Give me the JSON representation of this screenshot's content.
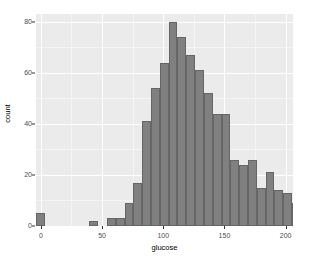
{
  "chart_data": {
    "type": "bar",
    "title": "",
    "subtitle": "",
    "xlabel": "glucose",
    "ylabel": "count",
    "xlim": [
      -4,
      206
    ],
    "ylim": [
      0,
      83
    ],
    "grid": true,
    "legend": "none",
    "x_ticks": [
      {
        "value": 0,
        "label": "0"
      },
      {
        "value": 50,
        "label": "50"
      },
      {
        "value": 100,
        "label": "100"
      },
      {
        "value": 150,
        "label": "150"
      },
      {
        "value": 200,
        "label": "200"
      }
    ],
    "y_ticks": [
      {
        "value": 0,
        "label": "0"
      },
      {
        "value": 20,
        "label": "20"
      },
      {
        "value": 40,
        "label": "40"
      },
      {
        "value": 60,
        "label": "60"
      },
      {
        "value": 80,
        "label": "80"
      }
    ],
    "x_minor_ticks": [
      25,
      75,
      125,
      175
    ],
    "y_minor_ticks": [
      10,
      30,
      50,
      70
    ],
    "bin_width": 7.2,
    "bins": [
      {
        "x_start": -3.6,
        "x_end": 3.6,
        "center": 0,
        "count": 5
      },
      {
        "x_start": 3.6,
        "x_end": 10.8,
        "center": 7.2,
        "count": 0
      },
      {
        "x_start": 10.8,
        "x_end": 18.0,
        "center": 14.4,
        "count": 0
      },
      {
        "x_start": 18.0,
        "x_end": 25.2,
        "center": 21.6,
        "count": 0
      },
      {
        "x_start": 25.2,
        "x_end": 32.4,
        "center": 28.8,
        "count": 0
      },
      {
        "x_start": 32.4,
        "x_end": 39.6,
        "center": 36.0,
        "count": 0
      },
      {
        "x_start": 39.6,
        "x_end": 46.8,
        "center": 43.2,
        "count": 2
      },
      {
        "x_start": 46.8,
        "x_end": 54.0,
        "center": 50.4,
        "count": 0
      },
      {
        "x_start": 54.0,
        "x_end": 61.2,
        "center": 57.6,
        "count": 3
      },
      {
        "x_start": 61.2,
        "x_end": 68.4,
        "center": 64.8,
        "count": 3
      },
      {
        "x_start": 68.4,
        "x_end": 75.6,
        "center": 72.0,
        "count": 9
      },
      {
        "x_start": 75.6,
        "x_end": 82.8,
        "center": 79.2,
        "count": 17
      },
      {
        "x_start": 82.8,
        "x_end": 90.0,
        "center": 86.4,
        "count": 41
      },
      {
        "x_start": 90.0,
        "x_end": 97.2,
        "center": 93.6,
        "count": 54
      },
      {
        "x_start": 97.2,
        "x_end": 104.4,
        "center": 100.8,
        "count": 64
      },
      {
        "x_start": 104.4,
        "x_end": 111.6,
        "center": 108.0,
        "count": 80
      },
      {
        "x_start": 111.6,
        "x_end": 118.8,
        "center": 115.2,
        "count": 74
      },
      {
        "x_start": 118.8,
        "x_end": 126.0,
        "center": 122.4,
        "count": 67
      },
      {
        "x_start": 126.0,
        "x_end": 133.2,
        "center": 129.6,
        "count": 61
      },
      {
        "x_start": 133.2,
        "x_end": 140.4,
        "center": 136.8,
        "count": 52
      },
      {
        "x_start": 140.4,
        "x_end": 147.6,
        "center": 144.0,
        "count": 44
      },
      {
        "x_start": 147.6,
        "x_end": 154.8,
        "center": 151.2,
        "count": 44
      },
      {
        "x_start": 154.8,
        "x_end": 162.0,
        "center": 158.4,
        "count": 26
      },
      {
        "x_start": 162.0,
        "x_end": 169.2,
        "center": 165.6,
        "count": 24
      },
      {
        "x_start": 169.2,
        "x_end": 176.4,
        "center": 172.8,
        "count": 26
      },
      {
        "x_start": 176.4,
        "x_end": 183.6,
        "center": 180.0,
        "count": 15
      },
      {
        "x_start": 183.6,
        "x_end": 190.8,
        "center": 187.2,
        "count": 21
      },
      {
        "x_start": 190.8,
        "x_end": 198.0,
        "center": 194.4,
        "count": 14
      },
      {
        "x_start": 198.0,
        "x_end": 205.2,
        "center": 201.6,
        "count": 13
      },
      {
        "x_start": 205.2,
        "x_end": 212.4,
        "center": 208.8,
        "count": 9
      }
    ],
    "colors": {
      "bar_fill": "#808080",
      "bar_border": "#666666",
      "panel_background": "#ebebeb",
      "grid_major": "#ffffff",
      "grid_minor": "#f5f5f5",
      "axis_text": "#4d4d4d",
      "axis_title": "#000000",
      "plot_background": "#ffffff"
    }
  }
}
